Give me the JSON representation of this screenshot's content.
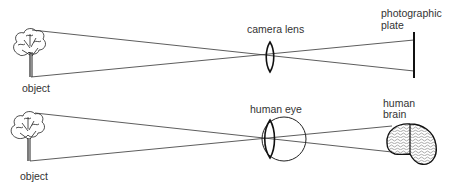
{
  "diagram": {
    "top": {
      "object_label": "object",
      "lens_label": "camera lens",
      "plate_label_line1": "photographic",
      "plate_label_line2": "plate"
    },
    "bottom": {
      "object_label": "object",
      "eye_label": "human eye",
      "brain_label_line1": "human",
      "brain_label_line2": "brain"
    },
    "colors": {
      "line": "#222222",
      "text": "#333333",
      "background": "#ffffff"
    }
  }
}
